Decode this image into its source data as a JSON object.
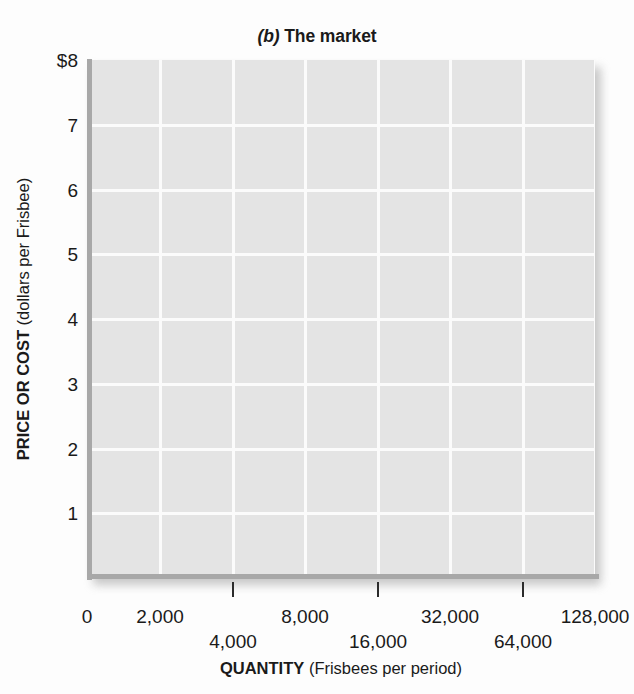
{
  "chart_data": {
    "type": "line",
    "title_paren": "(b)",
    "title_rest": "The market",
    "xlabel_strong": "QUANTITY",
    "xlabel_rest": "(Frisbees per period)",
    "ylabel_strong": "PRICE OR COST",
    "ylabel_rest": "(dollars per Frisbee)",
    "x_scale": "log2",
    "x_tick_values": [
      0,
      2000,
      4000,
      8000,
      16000,
      32000,
      64000,
      128000
    ],
    "x_tick_labels": [
      "0",
      "2,000",
      "4,000",
      "8,000",
      "16,000",
      "32,000",
      "64,000",
      "128,000"
    ],
    "x_tick_rows": [
      0,
      0,
      1,
      0,
      1,
      0,
      1,
      0
    ],
    "y_tick_values": [
      1,
      2,
      3,
      4,
      5,
      6,
      7,
      8
    ],
    "y_tick_labels": [
      "1",
      "2",
      "3",
      "4",
      "5",
      "6",
      "7",
      "$8"
    ],
    "ylim": [
      0,
      8
    ],
    "grid": true,
    "legend": "none",
    "series": [],
    "annotations": [],
    "plot_background": "#e4e4e4",
    "gridline_color": "#fbfbfb",
    "axis_color": "#a8a8a8",
    "text_color": "#1a1a1a",
    "page_background": "#fdfdfd"
  },
  "x_ticks": [
    {
      "label": "0",
      "px": 87,
      "row": 0,
      "tick": false
    },
    {
      "label": "2,000",
      "px": 160,
      "row": 0,
      "tick": false
    },
    {
      "label": "4,000",
      "px": 233,
      "row": 1,
      "tick": true
    },
    {
      "label": "8,000",
      "px": 305,
      "row": 0,
      "tick": false
    },
    {
      "label": "16,000",
      "px": 378,
      "row": 1,
      "tick": true
    },
    {
      "label": "32,000",
      "px": 450,
      "row": 0,
      "tick": false
    },
    {
      "label": "64,000",
      "px": 523,
      "row": 1,
      "tick": true
    },
    {
      "label": "128,000",
      "px": 595,
      "row": 0,
      "tick": false
    }
  ],
  "y_ticks": [
    {
      "label": "$8",
      "px": 60
    },
    {
      "label": "7",
      "px": 125
    },
    {
      "label": "6",
      "px": 190
    },
    {
      "label": "5",
      "px": 254
    },
    {
      "label": "4",
      "px": 319
    },
    {
      "label": "3",
      "px": 384
    },
    {
      "label": "2",
      "px": 449
    },
    {
      "label": "1",
      "px": 513
    }
  ]
}
